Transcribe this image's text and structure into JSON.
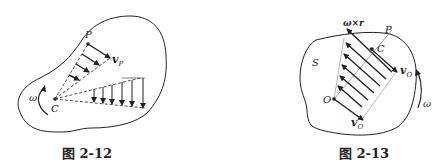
{
  "figures": [
    {
      "id": "fig-2-12",
      "caption": "图 2-12",
      "labels": {
        "point_p": "P",
        "velocity_p": "v",
        "velocity_p_sub": "P",
        "omega": "ω",
        "center_c": "C"
      },
      "description": "Rigid body rotating about instantaneous center C with angular velocity ω; velocity vectors perpendicular to radial lines from C, magnitude proportional to distance."
    },
    {
      "id": "fig-2-13",
      "caption": "图 2-13",
      "labels": {
        "cross_product": "ω×r",
        "point_p": "P",
        "center_c": "C",
        "region_s": "S",
        "velocity_o_top": "v",
        "velocity_o_top_sub": "O",
        "omega": "ω",
        "origin_o": "O",
        "velocity_o_bottom": "v",
        "velocity_o_bottom_sub": "O"
      },
      "description": "Rigid body S with reference point O; velocity vO plus ω×r gives velocity distribution along line OP, cancelling at point C."
    }
  ],
  "colors": {
    "ink": "#222222",
    "background": "#ffffff"
  }
}
